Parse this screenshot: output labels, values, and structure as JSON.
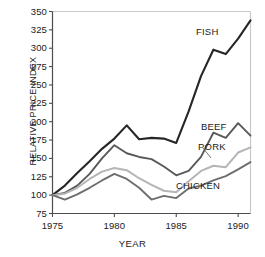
{
  "chart_data": {
    "type": "line",
    "title": "",
    "xlabel": "YEAR",
    "ylabel": "RELATIVE PRICE INDEX",
    "xlim": [
      1975,
      1991
    ],
    "ylim": [
      75,
      350
    ],
    "grid": false,
    "legend_position": "inline-annotations",
    "x": [
      1975,
      1976,
      1977,
      1978,
      1979,
      1980,
      1981,
      1982,
      1983,
      1984,
      1985,
      1986,
      1987,
      1988,
      1989,
      1990,
      1991
    ],
    "xticks": [
      "1975",
      "1980",
      "1985",
      "1990"
    ],
    "xtick_values": [
      1975,
      1980,
      1985,
      1990
    ],
    "yticks": [
      "75",
      "100",
      "125",
      "150",
      "175",
      "200",
      "225",
      "250",
      "275",
      "300",
      "325",
      "350"
    ],
    "ytick_values": [
      75,
      100,
      125,
      150,
      175,
      200,
      225,
      250,
      275,
      300,
      325,
      350
    ],
    "series": [
      {
        "name": "FISH",
        "color": "#262626",
        "width": 2.1,
        "label_x": 196,
        "label_y": 26,
        "values": [
          100,
          113,
          130,
          146,
          163,
          177,
          195,
          176,
          178,
          177,
          171,
          214,
          262,
          298,
          292,
          313,
          338
        ]
      },
      {
        "name": "BEEF",
        "color": "#595959",
        "width": 1.9,
        "label_x": 201,
        "label_y": 121,
        "values": [
          100,
          103,
          113,
          129,
          150,
          168,
          157,
          152,
          149,
          139,
          127,
          133,
          152,
          185,
          178,
          198,
          181
        ]
      },
      {
        "name": "PORK",
        "color": "#b5b5b5",
        "width": 2.0,
        "label_x": 198,
        "label_y": 141,
        "values": [
          100,
          102,
          110,
          122,
          132,
          137,
          134,
          123,
          114,
          106,
          104,
          119,
          133,
          140,
          138,
          158,
          165
        ]
      },
      {
        "name": "CHICKEN",
        "color": "#6e6e6e",
        "width": 1.9,
        "label_x": 176,
        "label_y": 180,
        "values": [
          100,
          94,
          101,
          110,
          120,
          129,
          122,
          110,
          94,
          99,
          96,
          109,
          113,
          120,
          126,
          135,
          145
        ]
      }
    ],
    "pork_leader_line": {
      "x1": 203,
      "y1": 148,
      "x2": 211,
      "y2": 158
    }
  },
  "axes": {
    "axis_color": "#4d4d4d",
    "frame_color": "#c9c9c9",
    "background": "#ffffff"
  }
}
